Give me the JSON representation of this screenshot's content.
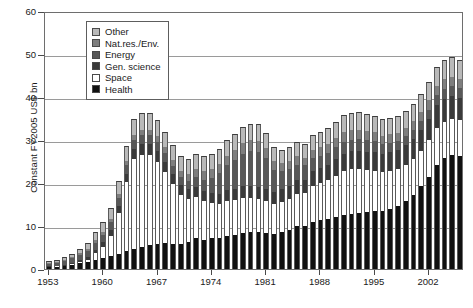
{
  "chart_data": {
    "type": "bar",
    "subtype": "stacked-bar",
    "title": "",
    "xlabel": "",
    "ylabel": "Constant FY2005 US$ bn",
    "ylim": [
      0,
      60
    ],
    "yticks": [
      0,
      10,
      20,
      30,
      40,
      50,
      60
    ],
    "grid": true,
    "legend_position": "top-left-inside",
    "x": [
      1953,
      1954,
      1955,
      1956,
      1957,
      1958,
      1959,
      1960,
      1961,
      1962,
      1963,
      1964,
      1965,
      1966,
      1967,
      1968,
      1969,
      1970,
      1971,
      1972,
      1973,
      1974,
      1975,
      1976,
      1977,
      1978,
      1979,
      1980,
      1981,
      1982,
      1983,
      1984,
      1985,
      1986,
      1987,
      1988,
      1989,
      1990,
      1991,
      1992,
      1993,
      1994,
      1995,
      1996,
      1997,
      1998,
      1999,
      2000,
      2001,
      2002,
      2003,
      2004,
      2005,
      2006
    ],
    "xticks": [
      1953,
      1960,
      1967,
      1974,
      1981,
      1988,
      1995,
      2002
    ],
    "series": [
      {
        "name": "Health",
        "color": "#111111",
        "values": [
          0.4,
          0.5,
          0.7,
          1.0,
          1.4,
          1.7,
          2.2,
          2.6,
          3.1,
          3.6,
          4.2,
          4.7,
          5.1,
          5.6,
          5.9,
          6.0,
          5.8,
          5.8,
          6.3,
          7.1,
          6.8,
          7.1,
          7.2,
          7.6,
          7.8,
          8.3,
          8.6,
          8.6,
          8.4,
          8.2,
          8.6,
          9.1,
          9.9,
          9.9,
          11.0,
          11.3,
          11.6,
          12.0,
          12.5,
          12.9,
          13.0,
          13.2,
          13.4,
          13.4,
          14.0,
          14.6,
          15.8,
          17.3,
          19.2,
          21.5,
          24.3,
          25.8,
          26.5,
          26.3
        ]
      },
      {
        "name": "Space",
        "color": "#ffffff",
        "values": [
          0.1,
          0.1,
          0.1,
          0.2,
          0.3,
          0.5,
          1.5,
          2.6,
          4.6,
          9.4,
          16.0,
          21.0,
          21.5,
          21.0,
          19.0,
          16.5,
          14.0,
          11.5,
          10.0,
          9.6,
          9.0,
          8.3,
          8.0,
          8.3,
          8.2,
          8.1,
          7.9,
          7.6,
          7.4,
          7.0,
          7.1,
          7.3,
          7.6,
          7.7,
          8.2,
          8.6,
          9.0,
          9.7,
          10.2,
          10.3,
          10.2,
          9.8,
          9.5,
          9.1,
          8.9,
          8.6,
          8.5,
          8.3,
          8.3,
          8.4,
          8.6,
          8.5,
          8.4,
          8.3
        ]
      },
      {
        "name": "Gen. science",
        "color": "#3a3a3a",
        "values": [
          0.1,
          0.2,
          0.2,
          0.3,
          0.4,
          0.6,
          0.8,
          1.0,
          1.3,
          1.6,
          1.9,
          2.2,
          2.4,
          2.5,
          2.6,
          2.5,
          2.4,
          2.3,
          2.3,
          2.4,
          2.3,
          2.2,
          2.3,
          2.4,
          2.6,
          2.8,
          2.9,
          2.9,
          2.8,
          2.7,
          2.8,
          3.0,
          3.2,
          3.2,
          3.5,
          3.6,
          3.7,
          3.9,
          4.1,
          4.2,
          4.3,
          4.3,
          4.3,
          4.2,
          4.3,
          4.4,
          4.5,
          4.7,
          4.8,
          5.0,
          5.2,
          5.3,
          5.3,
          5.2
        ]
      },
      {
        "name": "Energy",
        "color": "#585858",
        "values": [
          0.6,
          0.7,
          0.8,
          1.0,
          1.2,
          1.4,
          1.6,
          1.8,
          1.9,
          2.0,
          2.1,
          2.2,
          2.1,
          2.0,
          2.0,
          1.9,
          1.8,
          1.8,
          1.9,
          2.2,
          2.6,
          3.6,
          4.8,
          5.8,
          6.8,
          7.6,
          8.0,
          8.2,
          7.2,
          5.2,
          4.2,
          3.8,
          3.6,
          3.3,
          3.1,
          2.9,
          2.8,
          2.8,
          2.8,
          2.7,
          2.7,
          2.6,
          2.5,
          2.3,
          2.2,
          2.1,
          2.1,
          2.1,
          2.1,
          2.2,
          2.3,
          2.3,
          2.3,
          2.2
        ]
      },
      {
        "name": "Nat.res./Env.",
        "color": "#7e7e7e",
        "values": [
          0.2,
          0.2,
          0.3,
          0.3,
          0.4,
          0.5,
          0.6,
          0.7,
          0.8,
          0.9,
          1.0,
          1.1,
          1.2,
          1.3,
          1.4,
          1.4,
          1.4,
          1.5,
          1.7,
          1.9,
          2.0,
          2.1,
          2.1,
          2.2,
          2.3,
          2.4,
          2.5,
          2.5,
          2.3,
          2.0,
          1.9,
          1.9,
          1.9,
          1.8,
          1.9,
          2.0,
          2.0,
          2.1,
          2.2,
          2.2,
          2.2,
          2.2,
          2.1,
          2.0,
          2.0,
          2.0,
          2.0,
          2.1,
          2.1,
          2.1,
          2.2,
          2.2,
          2.2,
          2.1
        ]
      },
      {
        "name": "Other",
        "color": "#b9b9b9",
        "values": [
          0.4,
          0.5,
          0.6,
          0.8,
          1.0,
          1.4,
          1.8,
          2.2,
          2.6,
          3.0,
          3.4,
          3.8,
          3.9,
          3.9,
          3.8,
          3.6,
          3.4,
          3.3,
          3.4,
          3.6,
          3.6,
          3.5,
          3.5,
          3.6,
          3.7,
          3.8,
          3.9,
          3.9,
          3.6,
          3.2,
          3.1,
          3.2,
          3.3,
          3.2,
          3.4,
          3.5,
          3.6,
          3.8,
          4.0,
          4.1,
          4.1,
          4.0,
          3.9,
          3.8,
          3.8,
          3.8,
          3.9,
          4.0,
          4.1,
          4.3,
          4.5,
          4.6,
          4.6,
          4.5
        ]
      }
    ],
    "legend": [
      {
        "label": "Other",
        "color": "#b9b9b9"
      },
      {
        "label": "Nat.res./Env.",
        "color": "#7e7e7e"
      },
      {
        "label": "Energy",
        "color": "#585858"
      },
      {
        "label": "Gen. science",
        "color": "#3a3a3a"
      },
      {
        "label": "Space",
        "color": "#ffffff"
      },
      {
        "label": "Health",
        "color": "#111111"
      }
    ]
  }
}
